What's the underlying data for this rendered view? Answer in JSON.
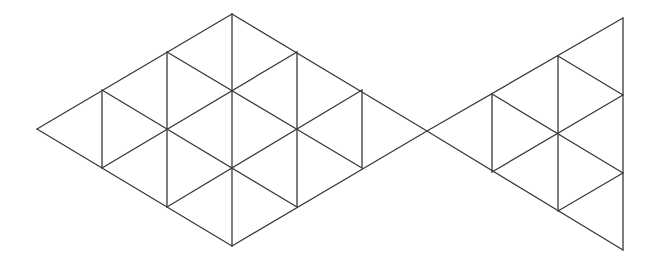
{
  "diagram": {
    "type": "triangle-grid",
    "stroke_color": "#3a3a3a",
    "background": "#ffffff",
    "body": {
      "shape": "rhombus",
      "triangle_count": 18,
      "vertices": {
        "left": [
          37,
          129
        ],
        "top": [
          232,
          14
        ],
        "right": [
          427,
          131
        ],
        "bottom": [
          232,
          246
        ]
      },
      "segments": [
        [
          37,
          129,
          232,
          14
        ],
        [
          232,
          14,
          427,
          131
        ],
        [
          427,
          131,
          232,
          246
        ],
        [
          232,
          246,
          37,
          129
        ],
        [
          102,
          90,
          102,
          168
        ],
        [
          167,
          52,
          167,
          207
        ],
        [
          232,
          14,
          232,
          246
        ],
        [
          297,
          52,
          297,
          207
        ],
        [
          362,
          90,
          362,
          168
        ],
        [
          102,
          90,
          297,
          207
        ],
        [
          167,
          52,
          362,
          168
        ],
        [
          102,
          168,
          297,
          52
        ],
        [
          167,
          207,
          362,
          90
        ]
      ]
    },
    "tail": {
      "shape": "triangle",
      "triangle_count": 9,
      "vertices": {
        "apex": [
          427,
          131
        ],
        "top": [
          623,
          18
        ],
        "bottom": [
          623,
          250
        ]
      },
      "segments": [
        [
          427,
          131,
          623,
          18
        ],
        [
          427,
          131,
          623,
          250
        ],
        [
          623,
          18,
          623,
          250
        ],
        [
          492,
          94,
          492,
          172
        ],
        [
          558,
          56,
          558,
          211
        ],
        [
          492,
          94,
          623,
          173
        ],
        [
          558,
          56,
          623,
          95
        ],
        [
          492,
          172,
          623,
          95
        ],
        [
          558,
          211,
          623,
          173
        ]
      ]
    }
  }
}
